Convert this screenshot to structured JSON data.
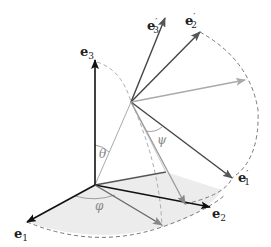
{
  "diagram": {
    "labels": {
      "e1": "e",
      "e1_sub": "1",
      "e2": "e",
      "e2_sub": "2",
      "e3": "e",
      "e3_sub": "3",
      "e1p": "e",
      "e1p_sub": "1",
      "e1p_prime": "′",
      "e2p": "e",
      "e2p_sub": "2",
      "e2p_prime": "′",
      "e3p": "e",
      "e3p_sub": "3",
      "e3p_prime": "′",
      "theta": "θ",
      "phi": "φ",
      "psi": "ψ"
    },
    "colors": {
      "black": "#111111",
      "dark_gray": "#555555",
      "mid_gray": "#888888",
      "light_gray": "#aaaaaa",
      "shade": "#ececec"
    }
  }
}
